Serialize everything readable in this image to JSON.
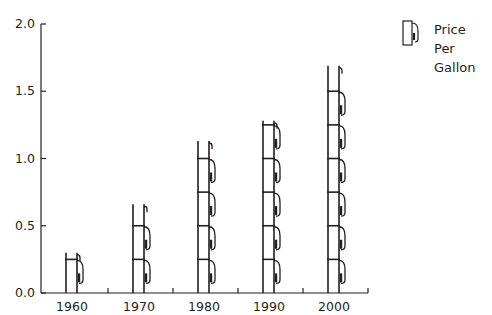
{
  "chart_data": {
    "type": "bar",
    "style": "pictograph (gas pump icons stacked)",
    "title": "",
    "xlabel": "",
    "ylabel": "",
    "categories": [
      "1960",
      "1970",
      "1980",
      "1990",
      "2000"
    ],
    "series": [
      {
        "name": "Price Per Gallon",
        "values": [
          0.3,
          0.66,
          1.13,
          1.28,
          1.69
        ]
      }
    ],
    "ylim": [
      0,
      2.0
    ],
    "yticks": [
      "0.0",
      "0.5",
      "1.0",
      "1.5",
      "2.0"
    ],
    "grid": false,
    "legend": {
      "position": "top-right",
      "entries": [
        "Price Per Gallon"
      ],
      "icon": "gas-pump-icon"
    },
    "icon_unit": 0.25
  },
  "legend": {
    "line1": "Price",
    "line2": "Per",
    "line3": "Gallon"
  },
  "colors": {
    "ink": "#231f20",
    "background": "#ffffff"
  }
}
